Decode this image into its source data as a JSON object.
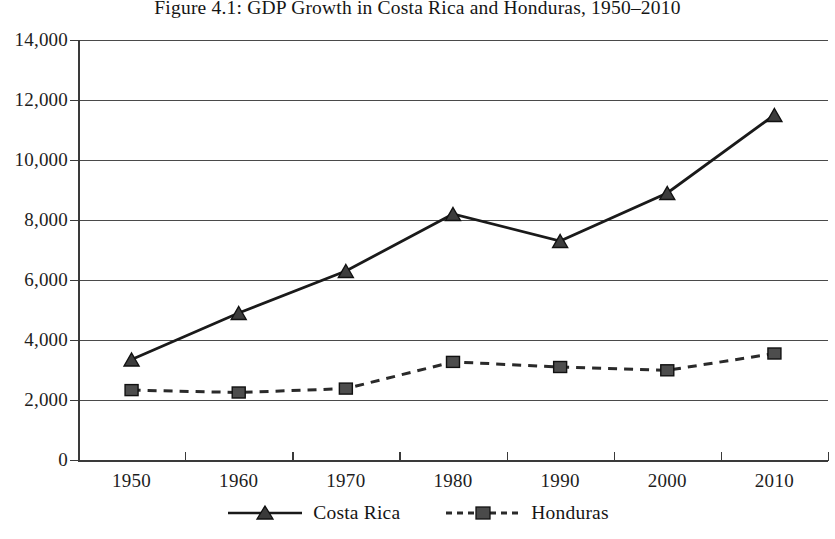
{
  "chart_data": {
    "type": "line",
    "title": "Figure 4.1: GDP Growth in Costa Rica and Honduras, 1950–2010",
    "xlabel": "",
    "ylabel": "",
    "categories": [
      "1950",
      "1960",
      "1970",
      "1980",
      "1990",
      "2000",
      "2010"
    ],
    "x": [
      1950,
      1960,
      1970,
      1980,
      1990,
      2000,
      2010
    ],
    "ylim": [
      0,
      14000
    ],
    "ytick_labels": [
      "0",
      "2,000",
      "4,000",
      "6,000",
      "8,000",
      "10,000",
      "12,000",
      "14,000"
    ],
    "ytick_values": [
      0,
      2000,
      4000,
      6000,
      8000,
      10000,
      12000,
      14000
    ],
    "grid": "horizontal",
    "legend_position": "bottom-center",
    "series": [
      {
        "name": "Costa Rica",
        "marker": "triangle",
        "line_style": "solid",
        "color": "#1a1a1a",
        "values": [
          3350,
          4900,
          6300,
          8200,
          7300,
          8900,
          11500
        ]
      },
      {
        "name": "Honduras",
        "marker": "square",
        "line_style": "dashed",
        "color": "#2a2a2a",
        "values": [
          2330,
          2250,
          2380,
          3270,
          3100,
          2990,
          3550
        ]
      }
    ]
  },
  "legend": {
    "items": [
      {
        "label": "Costa Rica",
        "icon": "solid-line-triangle-marker"
      },
      {
        "label": "Honduras",
        "icon": "dashed-line-square-marker"
      }
    ]
  }
}
